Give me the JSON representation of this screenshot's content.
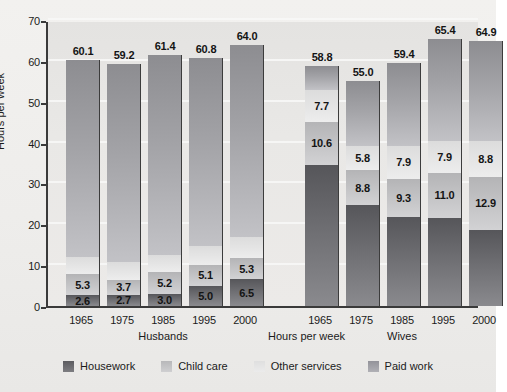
{
  "chart_data": {
    "type": "bar",
    "subtype": "stacked-bar-grouped",
    "title": "",
    "xlabel": "Hours per week",
    "ylabel": "Hours per week",
    "ylim": [
      0,
      70
    ],
    "yticks": [
      0,
      10,
      20,
      30,
      40,
      50,
      60,
      70
    ],
    "grid": true,
    "legend_position": "bottom",
    "legend": [
      "Housework",
      "Child care",
      "Other services",
      "Paid work"
    ],
    "series": [
      {
        "name": "Housework",
        "values": [
          2.6,
          2.7,
          3.0,
          5.0,
          6.5,
          34.5,
          24.6,
          21.9,
          21.6,
          18.7
        ]
      },
      {
        "name": "Child care",
        "values": [
          5.3,
          3.7,
          5.2,
          5.1,
          5.3,
          10.6,
          8.8,
          9.3,
          11.0,
          12.9
        ]
      },
      {
        "name": "Other services",
        "values": [
          4.1,
          4.3,
          4.4,
          4.7,
          5.0,
          7.7,
          5.8,
          7.9,
          7.9,
          8.8
        ]
      },
      {
        "name": "Paid work",
        "values": [
          48.1,
          48.5,
          48.8,
          46.0,
          47.2,
          6.0,
          15.8,
          20.3,
          24.9,
          24.5
        ]
      }
    ],
    "groups": [
      {
        "name": "Husbands",
        "categories": [
          "1965",
          "1975",
          "1985",
          "1995",
          "2000"
        ],
        "totals": [
          60.1,
          59.2,
          61.4,
          60.8,
          64.0
        ],
        "bars": [
          {
            "category": "1965",
            "total": 60.1,
            "housework": 2.6,
            "child_care": 5.3,
            "other_services": 4.1,
            "paid_work": 48.1,
            "labels": {
              "housework": "2.6",
              "child_care": "5.3",
              "other_services": "",
              "paid_work": "",
              "total": "60.1"
            }
          },
          {
            "category": "1975",
            "total": 59.2,
            "housework": 2.7,
            "child_care": 3.7,
            "other_services": 4.3,
            "paid_work": 48.5,
            "labels": {
              "housework": "2.7",
              "child_care": "3.7",
              "other_services": "",
              "paid_work": "",
              "total": "59.2"
            }
          },
          {
            "category": "1985",
            "total": 61.4,
            "housework": 3.0,
            "child_care": 5.2,
            "other_services": 4.4,
            "paid_work": 48.8,
            "labels": {
              "housework": "3.0",
              "child_care": "5.2",
              "other_services": "",
              "paid_work": "",
              "total": "61.4"
            }
          },
          {
            "category": "1995",
            "total": 60.8,
            "housework": 5.0,
            "child_care": 5.1,
            "other_services": 4.7,
            "paid_work": 46.0,
            "labels": {
              "housework": "5.0",
              "child_care": "5.1",
              "other_services": "",
              "paid_work": "",
              "total": "60.8"
            }
          },
          {
            "category": "2000",
            "total": 64.0,
            "housework": 6.5,
            "child_care": 5.3,
            "other_services": 5.0,
            "paid_work": 47.2,
            "labels": {
              "housework": "6.5",
              "child_care": "5.3",
              "other_services": "",
              "paid_work": "",
              "total": "64.0"
            }
          }
        ]
      },
      {
        "name": "Wives",
        "categories": [
          "1965",
          "1975",
          "1985",
          "1995",
          "2000"
        ],
        "totals": [
          58.8,
          55.0,
          59.4,
          65.4,
          64.9
        ],
        "bars": [
          {
            "category": "1965",
            "total": 58.8,
            "housework": 34.5,
            "child_care": 10.6,
            "other_services": 7.7,
            "paid_work": 6.0,
            "labels": {
              "housework": "",
              "child_care": "10.6",
              "other_services": "7.7",
              "paid_work": "",
              "total": "58.8"
            }
          },
          {
            "category": "1975",
            "total": 55.0,
            "housework": 24.6,
            "child_care": 8.8,
            "other_services": 5.8,
            "paid_work": 15.8,
            "labels": {
              "housework": "",
              "child_care": "8.8",
              "other_services": "5.8",
              "paid_work": "",
              "total": "55.0"
            }
          },
          {
            "category": "1985",
            "total": 59.4,
            "housework": 21.9,
            "child_care": 9.3,
            "other_services": 7.9,
            "paid_work": 20.3,
            "labels": {
              "housework": "",
              "child_care": "9.3",
              "other_services": "7.9",
              "paid_work": "",
              "total": "59.4"
            }
          },
          {
            "category": "1995",
            "total": 65.4,
            "housework": 21.6,
            "child_care": 11.0,
            "other_services": 7.9,
            "paid_work": 24.9,
            "labels": {
              "housework": "",
              "child_care": "11.0",
              "other_services": "7.9",
              "paid_work": "",
              "total": "65.4"
            }
          },
          {
            "category": "2000",
            "total": 64.9,
            "housework": 18.7,
            "child_care": 12.9,
            "other_services": 8.8,
            "paid_work": 24.5,
            "labels": {
              "housework": "",
              "child_care": "12.9",
              "other_services": "8.8",
              "paid_work": "",
              "total": "64.9"
            }
          }
        ]
      }
    ],
    "colors": {
      "housework": "#6e6e72",
      "child_care": "#c6c6c8",
      "other_services": "#e6e6e6",
      "paid_work": "#a3a3a7",
      "plot_background": "#e9e8e6",
      "figure_background": "#efeeec",
      "axis": "#3a3a3a",
      "gridline": "#f7f7f5",
      "text": "#1b1b1b"
    }
  },
  "axes": {
    "ylabel": "Hours per week",
    "mid_xlabel": "Hours per week",
    "yticks": [
      "70",
      "60",
      "50",
      "40",
      "30",
      "20",
      "10",
      "0"
    ]
  },
  "legend": {
    "items": [
      {
        "label": "Housework",
        "key": "housework"
      },
      {
        "label": "Child care",
        "key": "childcare"
      },
      {
        "label": "Other services",
        "key": "other"
      },
      {
        "label": "Paid work",
        "key": "paid"
      }
    ]
  }
}
